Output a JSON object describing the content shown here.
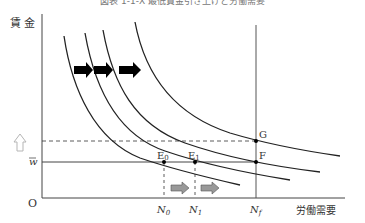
{
  "diagram": {
    "title": "図表 1-1-X 最低賃金引き上げと労働需要",
    "y_axis_label": "賃 金",
    "x_axis_label": "労働需要",
    "origin_label": "O",
    "wage_label": "w̄",
    "wage_label_overbar": "w",
    "points": {
      "E0": "E",
      "E0_sub": "0",
      "E1": "E",
      "E1_sub": "1",
      "F": "F",
      "G": "G"
    },
    "n_labels": {
      "N0": "N",
      "N0_sub": "0",
      "N1": "N",
      "N1_sub": "1",
      "Nf": "N",
      "Nf_sub": "f"
    },
    "colors": {
      "line": "#222222",
      "axis": "#444444",
      "arrow_black": "#000000",
      "arrow_gray_fill": "#999999",
      "arrow_outline": "#b5b5b5"
    }
  }
}
